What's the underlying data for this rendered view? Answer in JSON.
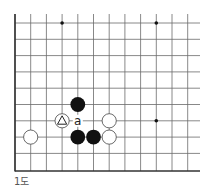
{
  "diagram": {
    "caption": "1도",
    "grid": {
      "cols": 13,
      "rows": 10,
      "x0": 15,
      "y0": 23,
      "dx": 15.7,
      "dy": 16.3,
      "right_edge": 200,
      "bottom_edge": 171,
      "open_top": true,
      "open_right": true
    },
    "colors": {
      "line": "#6a6a6a",
      "edge": "#333333",
      "black_stone": "#111111",
      "white_stone_fill": "#ffffff",
      "white_stone_stroke": "#444444"
    },
    "star_points": [
      {
        "col": 3,
        "row": 0
      },
      {
        "col": 9,
        "row": 0
      },
      {
        "col": 9,
        "row": 6
      }
    ],
    "stones": [
      {
        "color": "black",
        "col": 4,
        "row": 5
      },
      {
        "color": "black",
        "col": 4,
        "row": 7
      },
      {
        "color": "black",
        "col": 5,
        "row": 7
      },
      {
        "color": "white",
        "col": 1,
        "row": 7
      },
      {
        "color": "white",
        "col": 3,
        "row": 6,
        "mark": "triangle"
      },
      {
        "color": "white",
        "col": 6,
        "row": 6
      },
      {
        "color": "white",
        "col": 6,
        "row": 7
      }
    ],
    "labels": [
      {
        "text": "a",
        "col": 4,
        "row": 6
      }
    ]
  }
}
